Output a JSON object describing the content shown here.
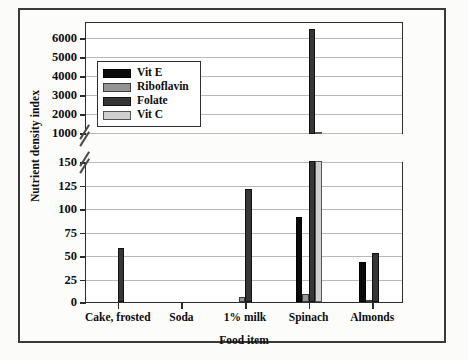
{
  "figure": {
    "ylabel": "Nutrient density index",
    "xlabel": "Food item"
  },
  "legend": {
    "items": [
      {
        "label": "Vit E",
        "color": "#0a0a0a"
      },
      {
        "label": "Riboflavin",
        "color": "#949494"
      },
      {
        "label": "Folate",
        "color": "#363636"
      },
      {
        "label": "Vit C",
        "color": "#cfcfcf"
      }
    ]
  },
  "axis_top": {
    "ticks": [
      "6000",
      "5000",
      "4000",
      "3000",
      "2000",
      "1000"
    ],
    "values": [
      6000,
      5000,
      4000,
      3000,
      2000,
      1000
    ],
    "min": 900,
    "max": 6800
  },
  "axis_bottom": {
    "ticks": [
      "150",
      "125",
      "100",
      "75",
      "50",
      "25",
      "0"
    ],
    "values": [
      150,
      125,
      100,
      75,
      50,
      25,
      0
    ],
    "min": 0,
    "max": 150
  },
  "chart_data": {
    "type": "bar",
    "title": "",
    "xlabel": "Food item",
    "ylabel": "Nutrient density index",
    "categories": [
      "Cake, frosted",
      "Soda",
      "1% milk",
      "Spinach",
      "Almonds"
    ],
    "series": [
      {
        "name": "Vit E",
        "color": "#0a0a0a",
        "values": [
          0,
          0,
          0,
          90,
          43
        ]
      },
      {
        "name": "Riboflavin",
        "color": "#949494",
        "values": [
          0,
          0,
          5,
          8,
          2
        ]
      },
      {
        "name": "Folate",
        "color": "#363636",
        "values": [
          57,
          0,
          120,
          6450,
          52
        ]
      },
      {
        "name": "Vit C",
        "color": "#cfcfcf",
        "values": [
          0,
          0,
          0,
          900,
          0
        ]
      }
    ],
    "broken_axis": true,
    "axis_break": {
      "lower_range": [
        0,
        150
      ],
      "upper_range": [
        900,
        6800
      ]
    },
    "ylim": [
      0,
      6800
    ],
    "grid": true,
    "legend_position": "upper-left-inset"
  }
}
